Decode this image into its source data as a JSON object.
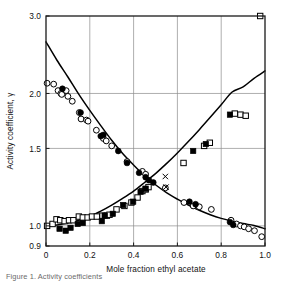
{
  "chart_data": {
    "type": "scatter",
    "title": "",
    "xlabel": "Mole fraction ethyl acetate",
    "ylabel": "Activity coefficient, γ",
    "xlim": [
      0.0,
      1.0
    ],
    "ylim": [
      0.9,
      3.0
    ],
    "yscale": "log",
    "xscale": "linear",
    "grid": true,
    "legend": "none",
    "xticks": [
      0,
      0.2,
      0.4,
      0.6,
      0.8,
      1.0
    ],
    "xtick_labels": [
      "0",
      "0.2",
      "0.4",
      "0.6",
      "0.8",
      "1.0"
    ],
    "yticks": [
      0.9,
      1.0,
      1.5,
      2.0,
      3.0
    ],
    "ytick_labels": [
      "0.9",
      "1.0",
      "1.5",
      "2.0",
      "3.0"
    ],
    "series": [
      {
        "name": "open-circle",
        "marker": "open-circle",
        "points": [
          [
            0.005,
            2.11
          ],
          [
            0.035,
            2.1
          ],
          [
            0.055,
            2.03
          ],
          [
            0.068,
            2.0
          ],
          [
            0.072,
            1.99
          ],
          [
            0.092,
            2.03
          ],
          [
            0.1,
            1.97
          ],
          [
            0.12,
            1.92
          ],
          [
            0.152,
            1.81
          ],
          [
            0.16,
            1.75
          ],
          [
            0.185,
            1.74
          ],
          [
            0.192,
            1.73
          ],
          [
            0.23,
            1.65
          ],
          [
            0.255,
            1.6
          ],
          [
            0.262,
            1.58
          ],
          [
            0.275,
            1.56
          ],
          [
            0.3,
            1.52
          ],
          [
            0.37,
            1.4
          ],
          [
            0.44,
            1.33
          ],
          [
            0.455,
            1.31
          ],
          [
            0.545,
            1.22
          ],
          [
            0.63,
            1.13
          ],
          [
            0.672,
            1.11
          ],
          [
            0.7,
            1.105
          ],
          [
            0.755,
            1.09
          ],
          [
            0.845,
            1.03
          ],
          [
            0.87,
            1.01
          ],
          [
            0.888,
            1.0
          ],
          [
            0.905,
            0.995
          ],
          [
            0.925,
            0.985
          ],
          [
            0.952,
            0.975
          ],
          [
            0.985,
            0.945
          ]
        ]
      },
      {
        "name": "filled-circle",
        "marker": "filled-circle",
        "points": [
          [
            0.075,
            2.05
          ],
          [
            0.158,
            1.81
          ],
          [
            0.25,
            1.6
          ],
          [
            0.262,
            1.61
          ],
          [
            0.33,
            1.48
          ],
          [
            0.37,
            1.39
          ],
          [
            0.425,
            1.32
          ],
          [
            0.455,
            1.29
          ],
          [
            0.47,
            1.27
          ],
          [
            0.49,
            1.255
          ],
          [
            0.655,
            1.135
          ],
          [
            0.683,
            1.12
          ],
          [
            0.84,
            1.02
          ],
          [
            0.855,
            1.005
          ]
        ]
      },
      {
        "name": "open-square",
        "marker": "open-square",
        "points": [
          [
            0.005,
            1.0
          ],
          [
            0.03,
            1.01
          ],
          [
            0.048,
            1.035
          ],
          [
            0.065,
            1.03
          ],
          [
            0.085,
            1.025
          ],
          [
            0.105,
            1.03
          ],
          [
            0.125,
            1.03
          ],
          [
            0.15,
            1.05
          ],
          [
            0.168,
            1.045
          ],
          [
            0.19,
            1.045
          ],
          [
            0.21,
            1.05
          ],
          [
            0.232,
            1.05
          ],
          [
            0.258,
            1.055
          ],
          [
            0.278,
            1.055
          ],
          [
            0.29,
            1.06
          ],
          [
            0.322,
            1.09
          ],
          [
            0.358,
            1.11
          ],
          [
            0.39,
            1.13
          ],
          [
            0.418,
            1.16
          ],
          [
            0.44,
            1.2
          ],
          [
            0.455,
            1.21
          ],
          [
            0.468,
            1.225
          ],
          [
            0.628,
            1.39
          ],
          [
            0.722,
            1.52
          ],
          [
            0.748,
            1.545
          ],
          [
            0.862,
            1.8
          ],
          [
            0.888,
            1.79
          ],
          [
            0.912,
            1.78
          ],
          [
            0.978,
            3.0
          ]
        ]
      },
      {
        "name": "filled-square",
        "marker": "filled-square",
        "points": [
          [
            0.062,
            0.985
          ],
          [
            0.09,
            0.975
          ],
          [
            0.112,
            0.99
          ],
          [
            0.145,
            1.01
          ],
          [
            0.168,
            1.015
          ],
          [
            0.255,
            1.025
          ],
          [
            0.268,
            1.055
          ],
          [
            0.305,
            1.065
          ],
          [
            0.352,
            1.115
          ],
          [
            0.398,
            1.135
          ],
          [
            0.432,
            1.195
          ],
          [
            0.455,
            1.215
          ],
          [
            0.672,
            1.48
          ],
          [
            0.73,
            1.535
          ],
          [
            0.84,
            1.79
          ]
        ]
      },
      {
        "name": "cross",
        "marker": "x",
        "points": [
          [
            0.545,
            1.295
          ],
          [
            0.548,
            1.225
          ]
        ]
      }
    ],
    "curves": [
      {
        "name": "descending-curve",
        "points": [
          [
            0.0,
            2.62
          ],
          [
            0.05,
            2.38
          ],
          [
            0.1,
            2.18
          ],
          [
            0.15,
            1.99
          ],
          [
            0.2,
            1.83
          ],
          [
            0.25,
            1.69
          ],
          [
            0.3,
            1.565
          ],
          [
            0.35,
            1.46
          ],
          [
            0.4,
            1.375
          ],
          [
            0.45,
            1.3
          ],
          [
            0.5,
            1.24
          ],
          [
            0.55,
            1.19
          ],
          [
            0.6,
            1.15
          ],
          [
            0.65,
            1.115
          ],
          [
            0.7,
            1.085
          ],
          [
            0.75,
            1.06
          ],
          [
            0.8,
            1.04
          ],
          [
            0.85,
            1.025
          ],
          [
            0.9,
            1.012
          ],
          [
            0.95,
            1.002
          ],
          [
            1.0,
            0.985
          ]
        ]
      },
      {
        "name": "ascending-curve",
        "points": [
          [
            0.0,
            1.0
          ],
          [
            0.05,
            1.005
          ],
          [
            0.1,
            1.015
          ],
          [
            0.15,
            1.03
          ],
          [
            0.2,
            1.05
          ],
          [
            0.25,
            1.08
          ],
          [
            0.3,
            1.115
          ],
          [
            0.35,
            1.155
          ],
          [
            0.4,
            1.2
          ],
          [
            0.45,
            1.255
          ],
          [
            0.5,
            1.315
          ],
          [
            0.55,
            1.385
          ],
          [
            0.6,
            1.465
          ],
          [
            0.65,
            1.555
          ],
          [
            0.7,
            1.655
          ],
          [
            0.75,
            1.765
          ],
          [
            0.8,
            1.885
          ],
          [
            0.85,
            2.015
          ],
          [
            0.9,
            2.07
          ],
          [
            0.95,
            2.165
          ],
          [
            1.0,
            2.25
          ]
        ]
      }
    ]
  },
  "caption": {
    "text": "Figure 1. Activity coefficients"
  },
  "colors": {
    "axis": "#1a1a1a",
    "grid": "#8c8c8c",
    "curve": "#000000",
    "marker_fill": "#000000",
    "marker_open": "#ffffff",
    "background": "#ffffff"
  }
}
